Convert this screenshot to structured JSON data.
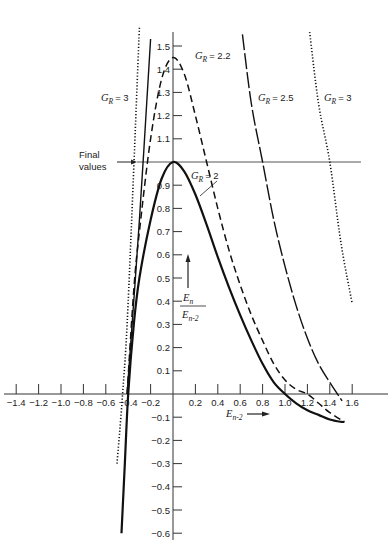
{
  "chart_data": {
    "type": "line",
    "title": "",
    "xlabel": "E_{n-2}",
    "ylabel": "E_n / E_{n-2}",
    "xlim": [
      -1.5,
      1.8
    ],
    "ylim": [
      -0.65,
      1.6
    ],
    "grid": false,
    "legend": "inline curve labels",
    "x_ticks": [
      -1.4,
      -1.2,
      -1.0,
      -0.8,
      -0.6,
      -0.4,
      -0.2,
      0.2,
      0.4,
      0.6,
      0.8,
      1.0,
      1.2,
      1.4,
      1.6
    ],
    "x_tick_labels": [
      "−1.4",
      "−1.2",
      "−1.0",
      "−0.8",
      "−0.6",
      "−0.4",
      "−0.2",
      "0.2",
      "0.4",
      "0.6",
      "0.8",
      "1.0",
      "1.2",
      "1.4",
      "1.6"
    ],
    "y_ticks": [
      1.5,
      1.4,
      1.3,
      1.2,
      1.1,
      0.9,
      0.8,
      0.7,
      0.6,
      0.5,
      0.4,
      0.3,
      0.2,
      0.1,
      -0.1,
      -0.2,
      -0.3,
      -0.4,
      -0.5,
      -0.6
    ],
    "y_tick_labels": [
      "1.5",
      "1.4",
      "1.3",
      "1.2",
      "1.1",
      "0.9",
      "0.8",
      "0.7",
      "0.6",
      "0.5",
      "0.4",
      "0.3",
      "0.2",
      "0.1",
      "−0.1",
      "−0.2",
      "−0.3",
      "−0.4",
      "−0.5",
      "−0.6"
    ],
    "reference_line": {
      "y": 1.0,
      "label": "Final values"
    },
    "series": [
      {
        "name": "G_R = 2",
        "style": "solid-thick",
        "x": [
          -0.46,
          -0.43,
          -0.4,
          -0.35,
          -0.3,
          -0.2,
          -0.1,
          0.0,
          0.1,
          0.2,
          0.3,
          0.4,
          0.5,
          0.6,
          0.7,
          0.8,
          0.9,
          1.0,
          1.1,
          1.2,
          1.3,
          1.4,
          1.5,
          1.53
        ],
        "y": [
          -0.6,
          -0.3,
          0.0,
          0.3,
          0.5,
          0.75,
          0.93,
          1.0,
          0.96,
          0.86,
          0.73,
          0.59,
          0.46,
          0.34,
          0.23,
          0.13,
          0.05,
          0.0,
          -0.04,
          -0.07,
          -0.09,
          -0.11,
          -0.12,
          -0.12
        ]
      },
      {
        "name": "G_R = 2.2",
        "style": "dashed",
        "x": [
          -0.41,
          -0.35,
          -0.3,
          -0.2,
          -0.1,
          0.0,
          0.1,
          0.2,
          0.3,
          0.4,
          0.5,
          0.6,
          0.7,
          0.8,
          0.9,
          1.0,
          1.1,
          1.2,
          1.3,
          1.4,
          1.53
        ],
        "y": [
          0.0,
          0.45,
          0.7,
          1.1,
          1.36,
          1.45,
          1.38,
          1.2,
          1.0,
          0.8,
          0.62,
          0.47,
          0.34,
          0.23,
          0.13,
          0.06,
          0.02,
          0.0,
          -0.04,
          -0.08,
          -0.12
        ]
      },
      {
        "name": "G_R = 2.5 (left branch)",
        "style": "solid-thin",
        "x": [
          -0.41,
          -0.3,
          -0.2
        ],
        "y": [
          0.0,
          0.75,
          1.53
        ]
      },
      {
        "name": "G_R = 2.5",
        "style": "long-dash",
        "x": [
          0.62,
          0.7,
          0.8,
          0.9,
          1.0,
          1.1,
          1.2,
          1.3,
          1.4,
          1.51
        ],
        "y": [
          1.55,
          1.25,
          1.0,
          0.75,
          0.55,
          0.38,
          0.24,
          0.13,
          0.05,
          -0.03
        ]
      },
      {
        "name": "G_R = 3 (left branch)",
        "style": "dotted",
        "x": [
          -0.5,
          -0.45,
          -0.4,
          -0.3
        ],
        "y": [
          -0.3,
          0.0,
          0.4,
          1.58
        ]
      },
      {
        "name": "G_R = 3",
        "style": "dotted",
        "x": [
          1.22,
          1.3,
          1.4,
          1.5,
          1.6
        ],
        "y": [
          1.56,
          1.25,
          1.0,
          0.65,
          0.39
        ]
      }
    ],
    "annotations": [
      {
        "text": "G_R = 3",
        "x": -0.9,
        "y": 1.3
      },
      {
        "text": "G_R = 2.2",
        "x": 0.3,
        "y": 1.46
      },
      {
        "text": "G_R = 2.5",
        "x": 0.9,
        "y": 1.3
      },
      {
        "text": "G_R = 3",
        "x": 1.5,
        "y": 1.3
      },
      {
        "text": "G_R = 2",
        "x": 0.25,
        "y": 0.96
      },
      {
        "text": "Final values",
        "x": -1.1,
        "y": 1.0
      }
    ]
  },
  "labels": {
    "final_values_line1": "Final",
    "final_values_line2": "values",
    "gr_symbol": "G",
    "gr_sub": "R",
    "gr3_left_value": "= 3",
    "gr22_value": "= 2.2",
    "gr25_value": "= 2.5",
    "gr3_right_value": "= 3",
    "gr2_value": "= 2",
    "ylabel_num": "E",
    "ylabel_num_sub": "n",
    "ylabel_den": "E",
    "ylabel_den_sub": "n-2",
    "xlabel": "E",
    "xlabel_sub": "n-2"
  }
}
